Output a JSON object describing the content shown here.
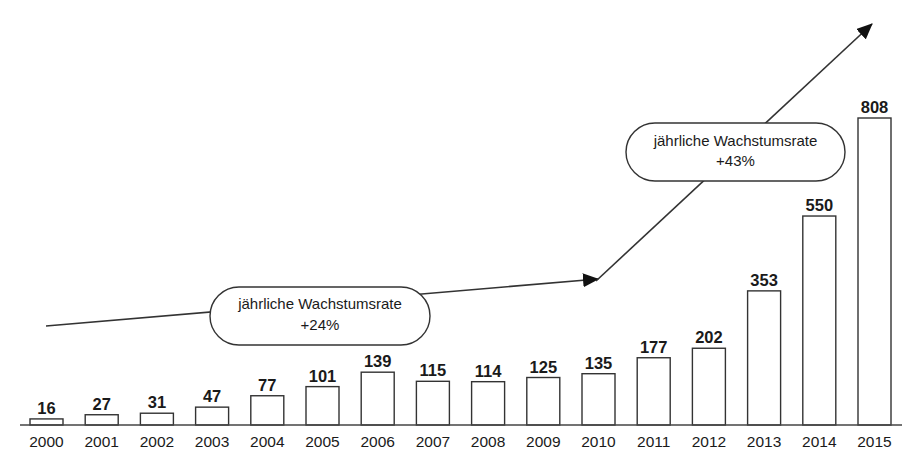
{
  "chart_data": {
    "type": "bar",
    "title": "",
    "xlabel": "",
    "ylabel": "",
    "grid": false,
    "legend": "none",
    "categories": [
      "2000",
      "2001",
      "2002",
      "2003",
      "2004",
      "2005",
      "2006",
      "2007",
      "2008",
      "2009",
      "2010",
      "2011",
      "2012",
      "2013",
      "2014",
      "2015"
    ],
    "values": [
      16,
      27,
      31,
      47,
      77,
      101,
      139,
      115,
      114,
      125,
      135,
      177,
      202,
      353,
      550,
      808
    ],
    "ylim": [
      0,
      808
    ],
    "annotations": [
      {
        "type": "trend-arrow",
        "from": "2000",
        "to": "2010",
        "label_line1": "jährliche Wachstumsrate",
        "label_line2": "+24%"
      },
      {
        "type": "trend-arrow",
        "from": "2010",
        "to": "2015+",
        "label_line1": "jährliche Wachstumsrate",
        "label_line2": "+43%"
      }
    ]
  },
  "colors": {
    "bar_fill": "#ffffff",
    "bar_stroke": "#333333",
    "text": "#1a1a1a"
  }
}
